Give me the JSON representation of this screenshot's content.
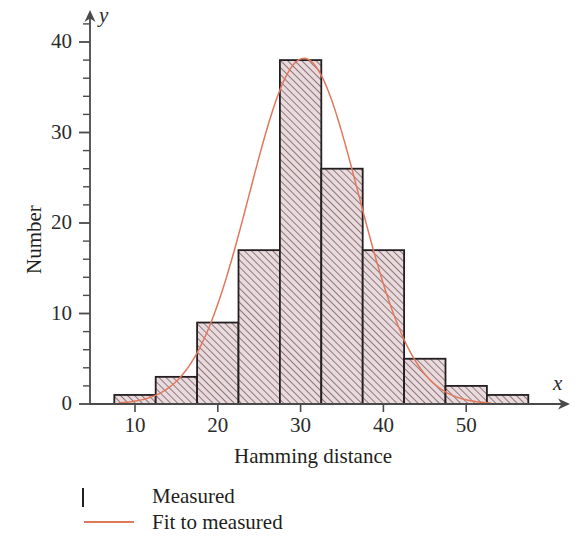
{
  "chart_data": {
    "type": "bar",
    "title": "",
    "subtitle": "",
    "xlabel": "Hamming distance",
    "ylabel": "Number",
    "x_axis_letter": "x",
    "y_axis_letter": "y",
    "xlim": [
      6,
      63
    ],
    "ylim": [
      0,
      42
    ],
    "xticks": [
      10,
      20,
      30,
      40,
      50
    ],
    "xtick_labels": [
      "10",
      "20",
      "30",
      "40",
      "50"
    ],
    "x_minor_tick_step": 5,
    "yticks": [
      0,
      10,
      20,
      30,
      40
    ],
    "ytick_labels": [
      "0",
      "10",
      "20",
      "30",
      "40"
    ],
    "y_minor_tick_step": 2,
    "grid": false,
    "bin_width": 5,
    "bins": [
      {
        "start": 7.5,
        "end": 12.5,
        "center": 10,
        "value": 1
      },
      {
        "start": 12.5,
        "end": 17.5,
        "center": 15,
        "value": 3
      },
      {
        "start": 17.5,
        "end": 22.5,
        "center": 20,
        "value": 9
      },
      {
        "start": 22.5,
        "end": 27.5,
        "center": 25,
        "value": 17
      },
      {
        "start": 27.5,
        "end": 32.5,
        "center": 30,
        "value": 38
      },
      {
        "start": 32.5,
        "end": 37.5,
        "center": 35,
        "value": 26
      },
      {
        "start": 37.5,
        "end": 42.5,
        "center": 40,
        "value": 17
      },
      {
        "start": 42.5,
        "end": 47.5,
        "center": 45,
        "value": 5
      },
      {
        "start": 47.5,
        "end": 52.5,
        "center": 50,
        "value": 2
      },
      {
        "start": 52.5,
        "end": 57.5,
        "center": 55,
        "value": 1
      }
    ],
    "categories": [
      "10",
      "15",
      "20",
      "25",
      "30",
      "35",
      "40",
      "45",
      "50",
      "55"
    ],
    "values": [
      1,
      3,
      9,
      17,
      38,
      26,
      17,
      5,
      2,
      1
    ],
    "series": [
      {
        "name": "Measured",
        "type": "bar",
        "values": [
          1,
          3,
          9,
          17,
          38,
          26,
          17,
          5,
          2,
          1
        ]
      },
      {
        "name": "Fit to measured",
        "type": "line",
        "fit": "gaussian",
        "amplitude": 38.2,
        "mean": 30.4,
        "sigma": 6.6,
        "x_range": [
          8,
          53
        ]
      }
    ],
    "legend": {
      "position": "below-left",
      "entries": [
        {
          "label": "Measured",
          "marker": "hatched-box",
          "color": "#e9dadd",
          "edge_color": "#231f20"
        },
        {
          "label": "Fit to measured",
          "marker": "line",
          "color": "#e0785c"
        }
      ]
    },
    "colors": {
      "bar_face": "#e9dadd",
      "bar_hatch": "#5e4145",
      "bar_edge": "#231f20",
      "fit_line": "#e0785c",
      "axis": "#4a4a4a",
      "text": "#231f20",
      "background": "#ffffff"
    }
  },
  "axes": {
    "x_title": "Hamming distance",
    "y_title": "Number",
    "x_letter": "x",
    "y_letter": "y"
  },
  "legend": {
    "measured_label": "Measured",
    "fit_label": "Fit to measured"
  },
  "ticks": {
    "x": [
      "10",
      "20",
      "30",
      "40",
      "50"
    ],
    "y": [
      "40",
      "30",
      "20",
      "10",
      "0"
    ]
  }
}
